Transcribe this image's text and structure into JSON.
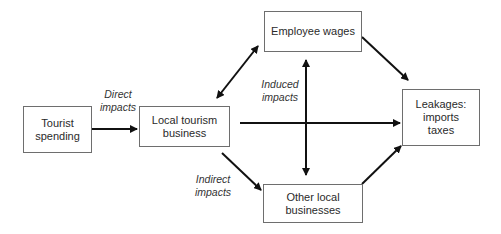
{
  "diagram": {
    "type": "flow",
    "nodes": [
      {
        "id": "tourist",
        "label_line1": "Tourist",
        "label_line2": "spending"
      },
      {
        "id": "local",
        "label_line1": "Local tourism",
        "label_line2": "business"
      },
      {
        "id": "wages",
        "label_line1": "Employee wages"
      },
      {
        "id": "leakages",
        "label_line1": "Leakages:",
        "label_line2": "imports",
        "label_line3": "taxes"
      },
      {
        "id": "other",
        "label_line1": "Other local",
        "label_line2": "businesses"
      }
    ],
    "labels": {
      "direct_line1": "Direct",
      "direct_line2": "impacts",
      "induced_line1": "Induced",
      "induced_line2": "impacts",
      "indirect_line1": "Indirect",
      "indirect_line2": "impacts"
    },
    "edges": [
      {
        "from": "tourist",
        "to": "local",
        "label": "Direct impacts"
      },
      {
        "from": "local",
        "to": "wages",
        "bidirectional": true
      },
      {
        "from": "local",
        "to": "other",
        "label": "Indirect impacts"
      },
      {
        "from": "local",
        "to": "leakages"
      },
      {
        "from": "wages",
        "to": "other",
        "bidirectional": true,
        "label": "Induced impacts"
      },
      {
        "from": "wages",
        "to": "leakages"
      },
      {
        "from": "other",
        "to": "leakages"
      }
    ],
    "colors": {
      "line": "#111111",
      "border": "#6e6e6e",
      "text": "#2a2a2a"
    }
  }
}
